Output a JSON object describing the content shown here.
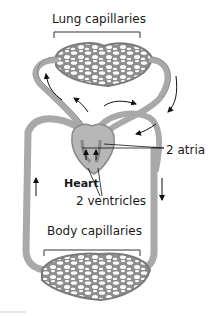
{
  "diagram": {
    "type": "circulatory-system-schematic",
    "labels": {
      "lung_capillaries": "Lung capillaries",
      "atria": "2 atria",
      "heart": "Heart",
      "ventricles": "2 ventricles",
      "body_capillaries": "Body capillaries"
    },
    "colors": {
      "vessel": "#a9a9a9",
      "vessel_dark": "#7a7a7a",
      "text": "#1a1a1a",
      "arrow": "#111111",
      "background": "#ffffff"
    }
  }
}
